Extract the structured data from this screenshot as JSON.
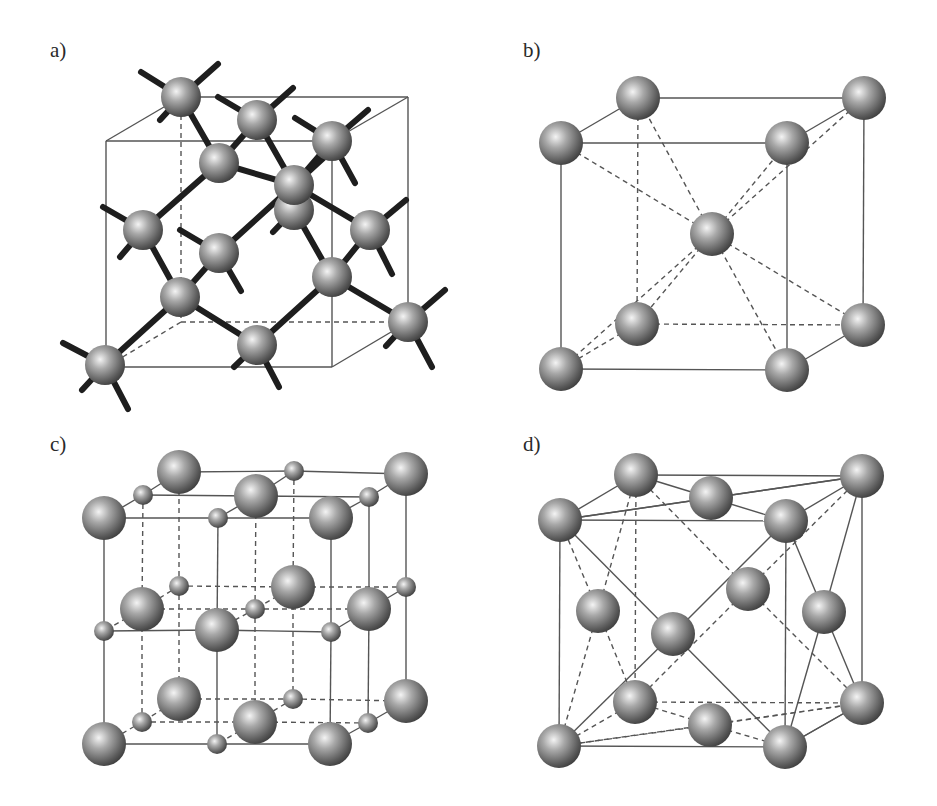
{
  "figure": {
    "panels": [
      {
        "id": "a",
        "label": "a)",
        "label_pos": [
          50,
          50
        ],
        "structure": "diamond cubic (tetrahedral bonding)",
        "cube": {
          "front": [
            [
              106,
              141
            ],
            [
              332,
              141
            ],
            [
              332,
              367
            ],
            [
              106,
              367
            ]
          ],
          "back": [
            [
              181,
              97
            ],
            [
              408,
              97
            ],
            [
              408,
              322
            ],
            [
              181,
              322
            ]
          ],
          "hidden_edges": [
            [
              [
                181,
                97
              ],
              [
                181,
                322
              ]
            ],
            [
              [
                181,
                322
              ],
              [
                408,
                322
              ]
            ],
            [
              [
                181,
                322
              ],
              [
                106,
                367
              ]
            ]
          ]
        },
        "atoms": [
          {
            "x": 181,
            "y": 97,
            "r": 20
          },
          {
            "x": 257,
            "y": 120,
            "r": 20
          },
          {
            "x": 332,
            "y": 141,
            "r": 20
          },
          {
            "x": 219,
            "y": 163,
            "r": 20
          },
          {
            "x": 294,
            "y": 210,
            "r": 20
          },
          {
            "x": 294,
            "y": 185,
            "r": 20
          },
          {
            "x": 143,
            "y": 230,
            "r": 20
          },
          {
            "x": 370,
            "y": 230,
            "r": 20
          },
          {
            "x": 219,
            "y": 253,
            "r": 20
          },
          {
            "x": 180,
            "y": 297,
            "r": 20
          },
          {
            "x": 332,
            "y": 277,
            "r": 20
          },
          {
            "x": 408,
            "y": 322,
            "r": 20
          },
          {
            "x": 257,
            "y": 345,
            "r": 20
          },
          {
            "x": 105,
            "y": 365,
            "r": 20
          }
        ],
        "bonds": [
          [
            [
              181,
              97
            ],
            [
              219,
              163
            ]
          ],
          [
            [
              257,
              120
            ],
            [
              219,
              163
            ]
          ],
          [
            [
              257,
              120
            ],
            [
              294,
              185
            ]
          ],
          [
            [
              332,
              141
            ],
            [
              294,
              185
            ]
          ],
          [
            [
              219,
              163
            ],
            [
              143,
              230
            ]
          ],
          [
            [
              219,
              163
            ],
            [
              294,
              185
            ]
          ],
          [
            [
              294,
              185
            ],
            [
              370,
              230
            ]
          ],
          [
            [
              294,
              185
            ],
            [
              219,
              253
            ]
          ],
          [
            [
              294,
              210
            ],
            [
              332,
              277
            ]
          ],
          [
            [
              143,
              230
            ],
            [
              180,
              297
            ]
          ],
          [
            [
              219,
              253
            ],
            [
              180,
              297
            ]
          ],
          [
            [
              370,
              230
            ],
            [
              332,
              277
            ]
          ],
          [
            [
              332,
              277
            ],
            [
              408,
              322
            ]
          ],
          [
            [
              332,
              277
            ],
            [
              257,
              345
            ]
          ],
          [
            [
              180,
              297
            ],
            [
              257,
              345
            ]
          ],
          [
            [
              180,
              297
            ],
            [
              105,
              365
            ]
          ]
        ],
        "stubs": [
          [
            [
              181,
              97
            ],
            [
              141,
              72
            ]
          ],
          [
            [
              181,
              97
            ],
            [
              218,
              64
            ]
          ],
          [
            [
              181,
              97
            ],
            [
              160,
              120
            ]
          ],
          [
            [
              257,
              120
            ],
            [
              218,
              97
            ]
          ],
          [
            [
              257,
              120
            ],
            [
              293,
              88
            ]
          ],
          [
            [
              332,
              141
            ],
            [
              295,
              118
            ]
          ],
          [
            [
              332,
              141
            ],
            [
              368,
              110
            ]
          ],
          [
            [
              332,
              141
            ],
            [
              355,
              183
            ]
          ],
          [
            [
              294,
              185
            ],
            [
              330,
              152
            ]
          ],
          [
            [
              294,
              210
            ],
            [
              273,
              232
            ]
          ],
          [
            [
              143,
              230
            ],
            [
              103,
              207
            ]
          ],
          [
            [
              143,
              230
            ],
            [
              120,
              257
            ]
          ],
          [
            [
              219,
              253
            ],
            [
              180,
              230
            ]
          ],
          [
            [
              219,
              253
            ],
            [
              241,
              291
            ]
          ],
          [
            [
              370,
              230
            ],
            [
              406,
              200
            ]
          ],
          [
            [
              370,
              230
            ],
            [
              392,
              274
            ]
          ],
          [
            [
              257,
              345
            ],
            [
              234,
              367
            ]
          ],
          [
            [
              257,
              345
            ],
            [
              279,
              387
            ]
          ],
          [
            [
              408,
              322
            ],
            [
              445,
              290
            ]
          ],
          [
            [
              408,
              322
            ],
            [
              386,
              346
            ]
          ],
          [
            [
              408,
              322
            ],
            [
              432,
              367
            ]
          ],
          [
            [
              105,
              365
            ],
            [
              63,
              343
            ]
          ],
          [
            [
              105,
              365
            ],
            [
              82,
              390
            ]
          ],
          [
            [
              105,
              365
            ],
            [
              128,
              409
            ]
          ]
        ]
      },
      {
        "id": "b",
        "label": "b)",
        "label_pos": [
          523,
          50
        ],
        "structure": "body-centered cubic (BCC)",
        "cube": {
          "front": [
            [
              561,
              143
            ],
            [
              787,
              143
            ],
            [
              787,
              370
            ],
            [
              561,
              369
            ]
          ],
          "back": [
            [
              638,
              98
            ],
            [
              864,
              98
            ],
            [
              863,
              325
            ],
            [
              637,
              324
            ]
          ],
          "hidden_edges": [
            [
              [
                638,
                98
              ],
              [
                637,
                324
              ]
            ],
            [
              [
                637,
                324
              ],
              [
                863,
                325
              ]
            ],
            [
              [
                637,
                324
              ],
              [
                561,
                369
              ]
            ]
          ]
        },
        "center": [
          712,
          234
        ],
        "atoms": [
          {
            "x": 638,
            "y": 98,
            "r": 22
          },
          {
            "x": 864,
            "y": 98,
            "r": 22
          },
          {
            "x": 561,
            "y": 143,
            "r": 22
          },
          {
            "x": 787,
            "y": 143,
            "r": 22
          },
          {
            "x": 712,
            "y": 234,
            "r": 22
          },
          {
            "x": 637,
            "y": 324,
            "r": 22
          },
          {
            "x": 863,
            "y": 325,
            "r": 22
          },
          {
            "x": 561,
            "y": 369,
            "r": 22
          },
          {
            "x": 787,
            "y": 370,
            "r": 22
          }
        ]
      },
      {
        "id": "c",
        "label": "c)",
        "label_pos": [
          50,
          443
        ],
        "structure": "rock salt (NaCl) — two interpenetrating FCC lattices",
        "large_atoms": [
          {
            "x": 179,
            "y": 472
          },
          {
            "x": 406,
            "y": 474
          },
          {
            "x": 256,
            "y": 496
          },
          {
            "x": 104,
            "y": 518
          },
          {
            "x": 331,
            "y": 518
          },
          {
            "x": 142,
            "y": 609
          },
          {
            "x": 293,
            "y": 587
          },
          {
            "x": 369,
            "y": 609
          },
          {
            "x": 217,
            "y": 630
          },
          {
            "x": 179,
            "y": 699
          },
          {
            "x": 406,
            "y": 701
          },
          {
            "x": 255,
            "y": 722
          },
          {
            "x": 104,
            "y": 744
          },
          {
            "x": 330,
            "y": 744
          }
        ],
        "small_atoms": [
          {
            "x": 143,
            "y": 495
          },
          {
            "x": 294,
            "y": 471
          },
          {
            "x": 369,
            "y": 497
          },
          {
            "x": 218,
            "y": 518
          },
          {
            "x": 179,
            "y": 586
          },
          {
            "x": 255,
            "y": 609
          },
          {
            "x": 104,
            "y": 631
          },
          {
            "x": 331,
            "y": 632
          },
          {
            "x": 406,
            "y": 587
          },
          {
            "x": 293,
            "y": 699
          },
          {
            "x": 142,
            "y": 722
          },
          {
            "x": 368,
            "y": 723
          },
          {
            "x": 217,
            "y": 744
          }
        ],
        "large_r": 22,
        "small_r": 10
      },
      {
        "id": "d",
        "label": "d)",
        "label_pos": [
          523,
          443
        ],
        "structure": "face-centered cubic (FCC)",
        "corners": {
          "btl": [
            636,
            475
          ],
          "btr": [
            862,
            476
          ],
          "ftl": [
            560,
            520
          ],
          "ftr": [
            786,
            521
          ],
          "bbl": [
            635,
            702
          ],
          "bbr": [
            862,
            703
          ],
          "fbl": [
            559,
            746
          ],
          "fbr": [
            785,
            747
          ]
        },
        "faces": {
          "top": [
            711,
            498
          ],
          "bottom": [
            710,
            725
          ],
          "left": [
            598,
            611
          ],
          "right": [
            824,
            612
          ],
          "back": [
            748,
            589
          ],
          "front": [
            673,
            634
          ]
        },
        "r": 22
      }
    ]
  },
  "colors": {
    "background": "#ffffff",
    "edge": "#555555",
    "bond": "#1e1e1e",
    "atom_highlight": "#f2f2f2",
    "atom_mid": "#9a9a9a",
    "atom_shadow": "#3c3c3c"
  }
}
